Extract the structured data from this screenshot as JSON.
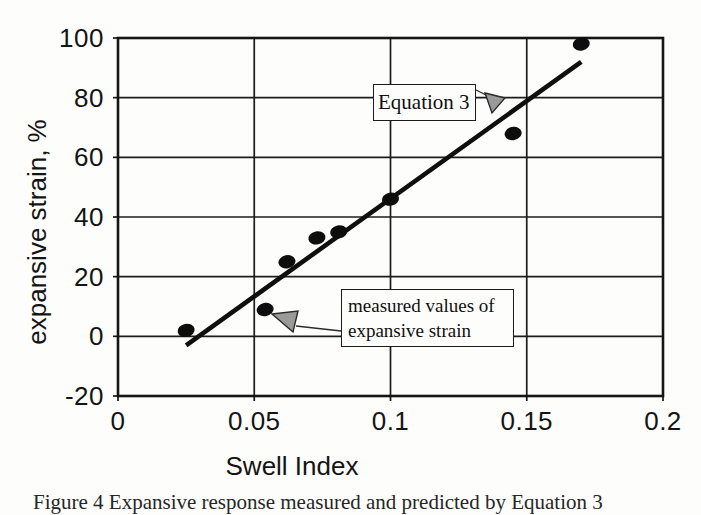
{
  "chart_data": {
    "type": "scatter",
    "title": "",
    "xlabel": "Swell Index",
    "ylabel": "expansive strain, %",
    "xlim": [
      0,
      0.2
    ],
    "ylim": [
      -20,
      100
    ],
    "grid": true,
    "x_ticks": [
      0,
      0.05,
      0.1,
      0.15,
      0.2
    ],
    "x_tick_labels": [
      "0",
      "0.05",
      "0.1",
      "0.15",
      "0.2"
    ],
    "y_ticks": [
      100,
      80,
      60,
      40,
      20,
      0,
      -20
    ],
    "y_tick_labels": [
      "100",
      "80",
      "60",
      "40",
      "20",
      "0",
      "-20"
    ],
    "series": [
      {
        "name": "measured values of expansive strain",
        "marker": "filled-ellipse",
        "points": [
          [
            0.025,
            2
          ],
          [
            0.054,
            9
          ],
          [
            0.062,
            25
          ],
          [
            0.073,
            33
          ],
          [
            0.081,
            35
          ],
          [
            0.1,
            46
          ],
          [
            0.145,
            68
          ],
          [
            0.17,
            98
          ]
        ]
      }
    ],
    "trend_line": {
      "name": "Equation 3",
      "from": [
        0.025,
        -3
      ],
      "to": [
        0.17,
        92
      ]
    }
  },
  "annotations": {
    "equation_label": "Equation 3",
    "measured_line1": "measured values of",
    "measured_line2": "expansive strain"
  },
  "caption": {
    "text": "Figure 4 Expansive response measured and predicted by Equation 3"
  },
  "colors": {
    "ink": "#111111",
    "grid_line": "#1c1c1c",
    "frame": "#151515",
    "point_fill": "#0d0d0d",
    "trend_line": "#0f0f0f",
    "arrow_fill": "#9a9a9a",
    "arrow_outline": "#2a2a2a",
    "background": "#fdfdfc"
  }
}
